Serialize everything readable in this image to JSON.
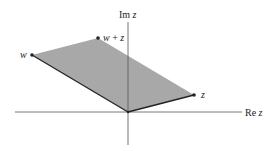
{
  "diagram": {
    "axes": {
      "x_label_prefix": "Re",
      "x_label_var": "z",
      "y_label_prefix": "Im",
      "y_label_var": "z"
    },
    "points": {
      "z": "z",
      "w": "w",
      "sum_w": "w",
      "sum_plus": " + ",
      "sum_z": "z"
    },
    "colors": {
      "fill": "#a8a8a8",
      "edge": "#222222",
      "axis": "#555555",
      "point": "#222222"
    }
  }
}
